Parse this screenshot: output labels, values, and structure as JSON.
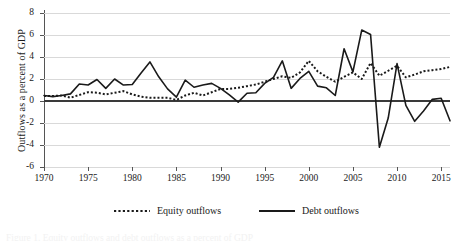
{
  "chart_data": {
    "type": "line",
    "title": "",
    "xlabel": "",
    "ylabel": "Outflows as a percent of GDP",
    "xlim": [
      1970,
      2016
    ],
    "ylim": [
      -6,
      8
    ],
    "ytick_step": 2,
    "xtick_step": 5,
    "grid": true,
    "legend_position": "bottom",
    "yticks": [
      "8",
      "6",
      "4",
      "2",
      "0",
      "-2",
      "-4",
      "-6"
    ],
    "xticks": [
      "1970",
      "1975",
      "1980",
      "1985",
      "1990",
      "1995",
      "2000",
      "2005",
      "2010",
      "2015"
    ],
    "x": [
      1970,
      1971,
      1972,
      1973,
      1974,
      1975,
      1976,
      1977,
      1978,
      1979,
      1980,
      1981,
      1982,
      1983,
      1984,
      1985,
      1986,
      1987,
      1988,
      1989,
      1990,
      1991,
      1992,
      1993,
      1994,
      1995,
      1996,
      1997,
      1998,
      1999,
      2000,
      2001,
      2002,
      2003,
      2004,
      2005,
      2006,
      2007,
      2008,
      2009,
      2010,
      2011,
      2012,
      2013,
      2014,
      2015,
      2016
    ],
    "series": [
      {
        "name": "Equity outflows",
        "style": "dotted",
        "color": "#1a1a1a",
        "values": [
          0.45,
          0.45,
          0.5,
          0.3,
          0.55,
          0.8,
          0.75,
          0.6,
          0.75,
          0.9,
          0.6,
          0.4,
          0.3,
          0.3,
          0.3,
          0.1,
          0.5,
          0.75,
          0.5,
          0.8,
          1.1,
          1.1,
          1.2,
          1.35,
          1.5,
          1.75,
          2.0,
          2.25,
          2.1,
          2.6,
          3.65,
          2.7,
          2.2,
          1.75,
          2.2,
          2.6,
          2.0,
          3.45,
          2.3,
          2.75,
          3.2,
          2.15,
          2.4,
          2.7,
          2.8,
          2.9,
          3.1
        ]
      },
      {
        "name": "Debt outflows",
        "style": "solid",
        "color": "#1a1a1a",
        "values": [
          0.5,
          0.4,
          0.5,
          0.65,
          1.55,
          1.45,
          1.95,
          1.15,
          2.0,
          1.45,
          1.5,
          2.55,
          3.55,
          2.2,
          1.1,
          0.35,
          1.9,
          1.25,
          1.45,
          1.6,
          1.15,
          0.55,
          -0.1,
          0.7,
          0.75,
          1.6,
          2.15,
          3.65,
          1.15,
          2.05,
          2.7,
          1.35,
          1.2,
          0.5,
          4.75,
          2.65,
          6.45,
          6.05,
          -4.2,
          -1.55,
          3.4,
          -0.4,
          -1.85,
          -0.9,
          0.15,
          0.25,
          -1.8
        ]
      }
    ]
  },
  "axis": {
    "y_title": "Outflows as a percent of GDP"
  },
  "legend": {
    "items": [
      {
        "label": "Equity outflows",
        "key": "dotted-line-key"
      },
      {
        "label": "Debt outflows",
        "key": "solid-line-key"
      }
    ]
  },
  "caption": {
    "text": "Figure 1. Equity outflows and debt outflows as a percent of GDP"
  }
}
